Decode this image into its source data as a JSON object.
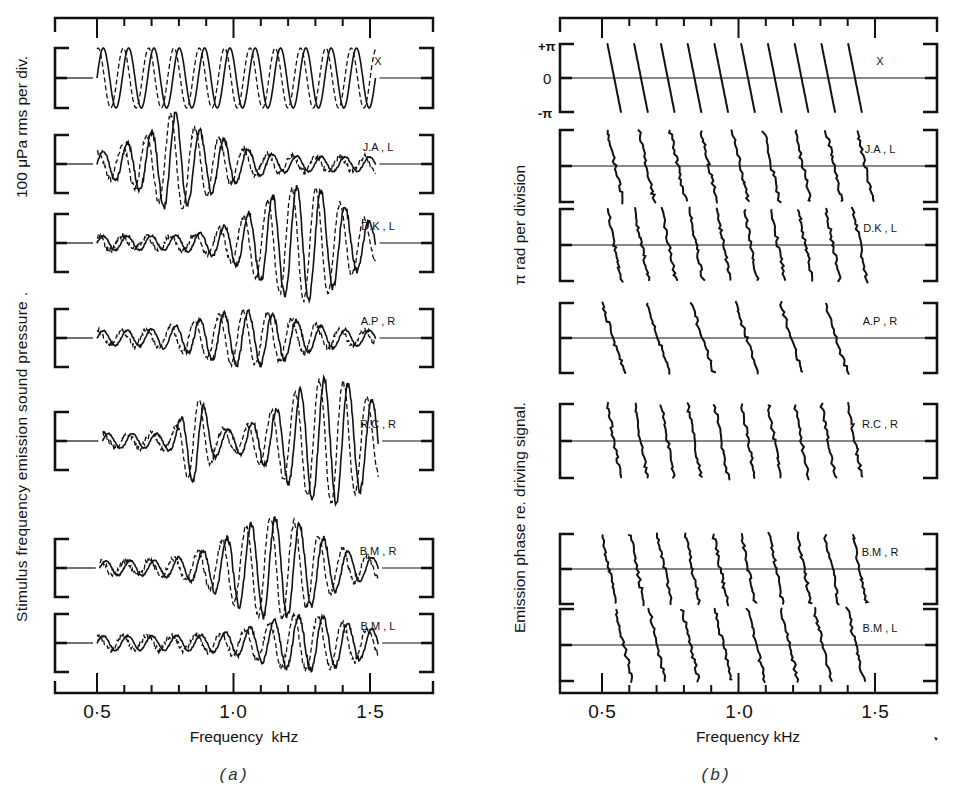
{
  "figure": {
    "panels": [
      {
        "id": "a",
        "caption": "(a)",
        "ylabel_main": "Stimulus frequency  emission sound pressure .",
        "ylabel_scale": "100 μPa rms per div.",
        "xlabel": "Frequency  kHz",
        "xticks": [
          "0·5",
          "1·0",
          "1·5"
        ]
      },
      {
        "id": "b",
        "caption": "(b)",
        "ylabel_main": "Emission phase  re. driving signal.",
        "ylabel_scale": "π rad per division",
        "xlabel": "Frequency kHz",
        "xticks": [
          "0·5",
          "1·0",
          "1·5"
        ],
        "phase_ticks": [
          "+π",
          "0",
          "-π"
        ]
      }
    ],
    "subjects": [
      "X",
      "J.A , L",
      "D.K , L",
      "A.P , R",
      "R.C , R",
      "B.M , R",
      "B.M , L"
    ]
  },
  "chart_data": [
    {
      "type": "line",
      "title": "(a) Stimulus frequency emission sound pressure",
      "xlabel": "Frequency kHz",
      "ylabel": "Stimulus frequency emission sound pressure. 100 μPa rms per div.",
      "xlim": [
        0.4,
        1.75
      ],
      "xticks": [
        0.5,
        1.0,
        1.5
      ],
      "minor_tick_step": 0.1,
      "grid": false,
      "legend": "solid = in-phase component, dashed = quadrature component (per subject trace)",
      "series": [
        {
          "name": "X",
          "freq_range_kHz": [
            0.5,
            1.52
          ],
          "amplitude_div": 1.0,
          "cycles": 11,
          "note": "reference sinusoid pair, solid and dashed"
        },
        {
          "name": "J.A , L",
          "freq_range_kHz": [
            0.5,
            1.52
          ],
          "peak_amplitude_div": 1.0,
          "peak_freq_kHz": 0.8
        },
        {
          "name": "D.K , L",
          "freq_range_kHz": [
            0.5,
            1.52
          ],
          "peak_amplitude_div": 1.7,
          "peak_freq_kHz": 1.25
        },
        {
          "name": "A.P , R",
          "freq_range_kHz": [
            0.5,
            1.52
          ],
          "peak_amplitude_div": 0.7,
          "peak_freq_kHz": 1.05
        },
        {
          "name": "R.C , R",
          "freq_range_kHz": [
            0.52,
            1.53
          ],
          "peak_amplitude_div": 1.9,
          "peak_freq_kHz": 1.35
        },
        {
          "name": "B.M , R",
          "freq_range_kHz": [
            0.51,
            1.53
          ],
          "peak_amplitude_div": 1.5,
          "peak_freq_kHz": 1.15
        },
        {
          "name": "B.M , L",
          "freq_range_kHz": [
            0.5,
            1.53
          ],
          "peak_amplitude_div": 0.7,
          "peak_freq_kHz": 1.27
        }
      ]
    },
    {
      "type": "line",
      "title": "(b) Emission phase re. driving signal",
      "xlabel": "Frequency kHz",
      "ylabel": "Emission phase re. driving signal. π rad per division",
      "xlim": [
        0.4,
        1.75
      ],
      "xticks": [
        0.5,
        1.0,
        1.5
      ],
      "yticks": [
        "+π",
        "0",
        "-π"
      ],
      "grid": false,
      "series": [
        {
          "name": "X",
          "freq_range_kHz": [
            0.52,
            1.5
          ],
          "phase_wraps": 10,
          "note": "regular sawtooth phase from +π to -π"
        },
        {
          "name": "J.A , L",
          "freq_range_kHz": [
            0.52,
            1.55
          ],
          "phase_wraps": 9
        },
        {
          "name": "D.K , L",
          "freq_range_kHz": [
            0.52,
            1.52
          ],
          "phase_wraps": 10
        },
        {
          "name": "A.P , R",
          "freq_range_kHz": [
            0.5,
            1.48
          ],
          "phase_wraps": 6
        },
        {
          "name": "R.C , R",
          "freq_range_kHz": [
            0.52,
            1.5
          ],
          "phase_wraps": 10
        },
        {
          "name": "B.M , R",
          "freq_range_kHz": [
            0.5,
            1.52
          ],
          "phase_wraps": 10
        },
        {
          "name": "B.M , L",
          "freq_range_kHz": [
            0.55,
            1.52
          ],
          "phase_wraps": 8
        }
      ]
    }
  ]
}
